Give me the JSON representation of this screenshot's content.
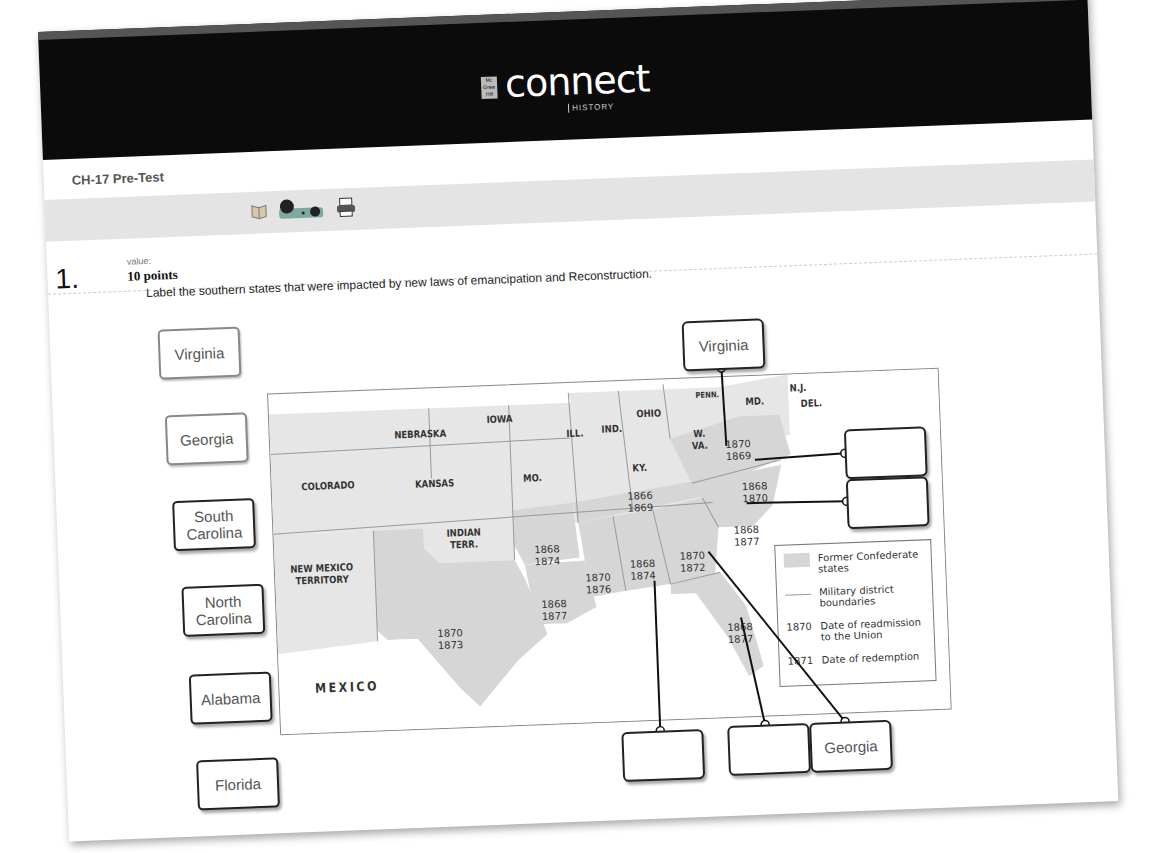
{
  "header": {
    "brand": "connect",
    "brand_sub": "HISTORY",
    "publisher_mark": "Mc Graw Hill"
  },
  "assignment": {
    "title": "CH-17 Pre-Test"
  },
  "toolbar": {
    "icons": [
      "ebook-icon",
      "media-icon",
      "print-icon"
    ]
  },
  "question": {
    "number": "1.",
    "value_label": "value:",
    "points": "10 points",
    "prompt": "Label the southern states that were impacted by new laws of emancipation and Reconstruction."
  },
  "drag_chips": [
    {
      "label": "Virginia",
      "used": true
    },
    {
      "label": "Georgia",
      "used": true
    },
    {
      "label": "South Carolina",
      "used": false
    },
    {
      "label": "North Carolina",
      "used": false
    },
    {
      "label": "Alabama",
      "used": false
    },
    {
      "label": "Florida",
      "used": false
    }
  ],
  "drop_targets": [
    {
      "id": "virginia-target",
      "value": "Virginia"
    },
    {
      "id": "north-carolina-target",
      "value": ""
    },
    {
      "id": "south-carolina-target",
      "value": ""
    },
    {
      "id": "alabama-target",
      "value": ""
    },
    {
      "id": "florida-target",
      "value": ""
    },
    {
      "id": "georgia-target",
      "value": "Georgia"
    }
  ],
  "map": {
    "state_labels": {
      "nebraska": "NEBRASKA",
      "iowa": "IOWA",
      "ill": "ILL.",
      "ind": "IND.",
      "ohio": "OHIO",
      "penn": "PENN.",
      "md": "MD.",
      "nj": "N.J.",
      "del": "DEL.",
      "wva_1": "W.",
      "wva_2": "VA.",
      "colorado": "COLORADO",
      "kansas": "KANSAS",
      "mo": "MO.",
      "ky": "KY.",
      "indian_terr_1": "INDIAN",
      "indian_terr_2": "TERR.",
      "new_mexico_1": "NEW MEXICO",
      "new_mexico_2": "TERRITORY",
      "mexico": "MEXICO"
    },
    "dates": {
      "virginia": [
        "1870",
        "1869"
      ],
      "north_carolina": [
        "1868",
        "1870"
      ],
      "tennessee": [
        "1866",
        "1869"
      ],
      "south_carolina": [
        "1868",
        "1877"
      ],
      "arkansas": [
        "1868",
        "1874"
      ],
      "mississippi": [
        "1870",
        "1876"
      ],
      "alabama": [
        "1868",
        "1874"
      ],
      "georgia": [
        "1870",
        "1872"
      ],
      "louisiana": [
        "1868",
        "1877"
      ],
      "texas": [
        "1870",
        "1873"
      ],
      "florida": [
        "1868",
        "1877"
      ]
    },
    "legend": {
      "confederate": "Former Confederate states",
      "military": "Military district boundaries",
      "readmission_year": "1870",
      "readmission": "Date of readmission to the Union",
      "redemption_year": "1871",
      "redemption": "Date of redemption"
    },
    "colors": {
      "confederate_fill": "#d9d9d9",
      "other_fill": "#e6e6e6",
      "border": "#999999"
    }
  }
}
